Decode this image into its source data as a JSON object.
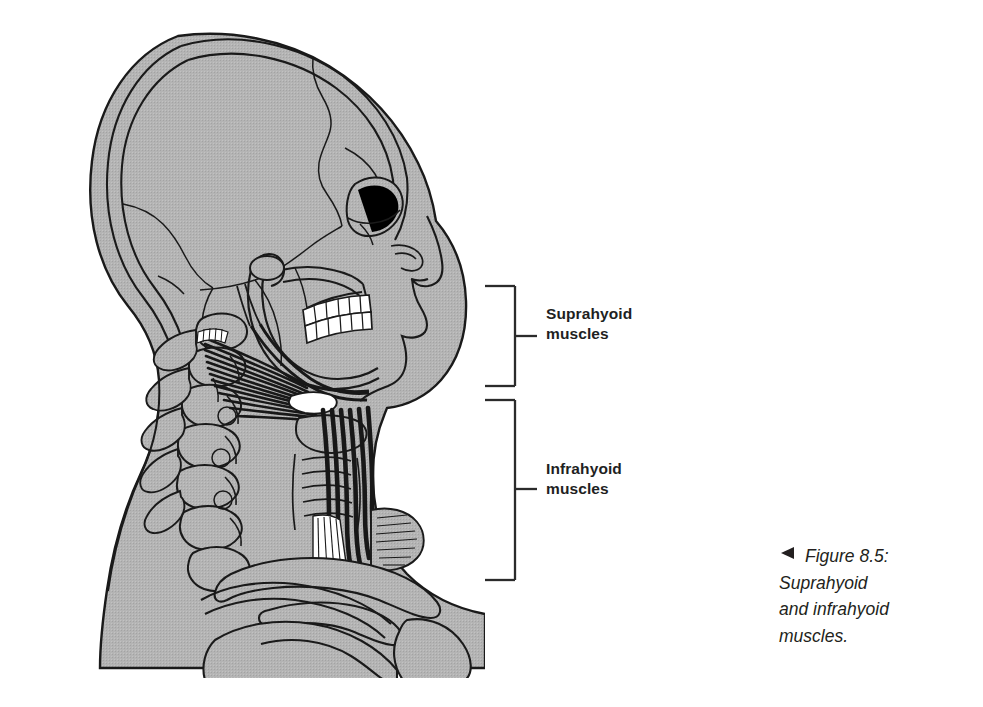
{
  "figure": {
    "type": "anatomical-illustration",
    "background_color": "#ffffff",
    "bone_fill_color": "#b0b0b0",
    "outline_color": "#1a1a1a",
    "muscle_color": "#1c1c1c",
    "tooth_color": "#ffffff"
  },
  "labels": {
    "suprahyoid": "Suprahyoid\nmuscles",
    "infrahyoid": "Infrahyoid\nmuscles",
    "text_color": "#221f1f"
  },
  "brackets": {
    "line_color": "#2b2b2b",
    "suprahyoid": {
      "top": 285,
      "bottom": 385,
      "left": 485,
      "spine_x": 515,
      "tick_y": 335,
      "tick_end": 536
    },
    "infrahyoid": {
      "top": 400,
      "bottom": 578,
      "left": 485,
      "spine_x": 515,
      "tick_y": 489,
      "tick_end": 536
    }
  },
  "caption": {
    "marker": "caption-arrow-left",
    "text": "Figure 8.5:\nSuprahyoid\nand infrahyoid\nmuscles.",
    "color": "#231f20"
  }
}
